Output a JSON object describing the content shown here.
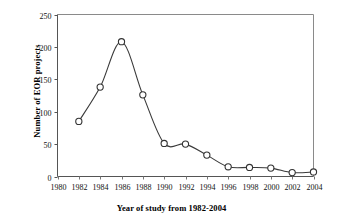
{
  "chart_data": {
    "type": "line",
    "title": "",
    "xlabel": "Year of study from 1982-2004",
    "ylabel": "Number of EOR projects",
    "x": [
      1982,
      1984,
      1986,
      1988,
      1990,
      1992,
      1994,
      1996,
      1998,
      2000,
      2002,
      2004
    ],
    "values": [
      85,
      138,
      208,
      126,
      51,
      50,
      33,
      15,
      14,
      13,
      6,
      7
    ],
    "series": [
      {
        "name": "Number of EOR projects",
        "values": [
          85,
          138,
          208,
          126,
          51,
          50,
          33,
          15,
          14,
          13,
          6,
          7
        ]
      }
    ],
    "xlim": [
      1980,
      2004
    ],
    "ylim": [
      0,
      250
    ],
    "xticks": [
      1980,
      1982,
      1984,
      1986,
      1988,
      1990,
      1992,
      1994,
      1996,
      1998,
      2000,
      2002,
      2004
    ],
    "xtick_labels": [
      "1980",
      "1982",
      "1984",
      "1986",
      "1988",
      "1990",
      "1992",
      "1994",
      "1996",
      "1998",
      "2000",
      "2002",
      "2004"
    ],
    "yticks": [
      0,
      50,
      100,
      150,
      200,
      250
    ],
    "ytick_labels": [
      "0",
      "50",
      "100",
      "150",
      "200",
      "250"
    ],
    "grid": false,
    "legend": false,
    "legend_position": "none",
    "marker": "open-circle",
    "line_color": "#3a3a3a",
    "marker_fill": "#ffffff",
    "marker_edge": "#333333",
    "background": "#ffffff"
  }
}
